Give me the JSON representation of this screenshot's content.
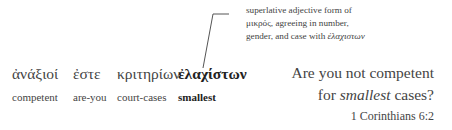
{
  "annotation": {
    "lines": [
      "superlative adjective form of",
      "μικρός, agreeing in number,",
      "gender, and case with"
    ],
    "line3_italic": "ἐλαχιστων"
  },
  "interlinear": [
    {
      "greek": "ἀνάξιοί",
      "gloss": "competent",
      "bold": false
    },
    {
      "greek": "ἐστε",
      "gloss": "are-you",
      "bold": false
    },
    {
      "greek": "κριτηρίων",
      "gloss": "court-cases",
      "bold": false
    },
    {
      "greek": "ἐλαχίστων",
      "gloss": "smallest",
      "bold": true
    }
  ],
  "translation": {
    "line1": "Are you not competent",
    "line2_before": "for ",
    "line2_italic": "smallest",
    "line2_after": " cases?"
  },
  "reference": "1 Corinthians 6:2"
}
